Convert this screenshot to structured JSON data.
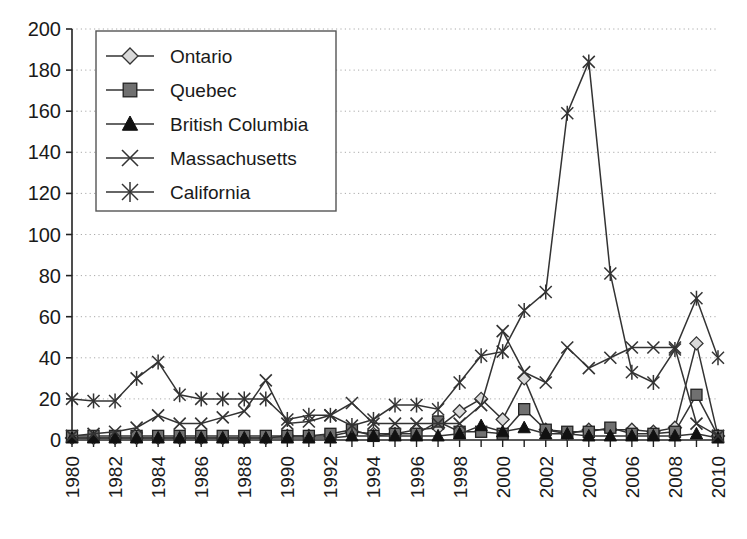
{
  "chart_data": {
    "type": "line",
    "title": "",
    "subtitle": "",
    "xlabel": "",
    "ylabel": "",
    "xlim": [
      1980,
      2010
    ],
    "ylim": [
      0,
      200
    ],
    "y_ticks": [
      0,
      20,
      40,
      60,
      80,
      100,
      120,
      140,
      160,
      180,
      200
    ],
    "y_tick_labels": [
      "0",
      "20",
      "40",
      "60",
      "80",
      "100",
      "120",
      "140",
      "160",
      "180",
      "200"
    ],
    "x": [
      1980,
      1981,
      1982,
      1983,
      1984,
      1985,
      1986,
      1987,
      1988,
      1989,
      1990,
      1991,
      1992,
      1993,
      1994,
      1995,
      1996,
      1997,
      1998,
      1999,
      2000,
      2001,
      2002,
      2003,
      2004,
      2005,
      2006,
      2007,
      2008,
      2009,
      2010
    ],
    "x_tick_labels": [
      "1980",
      "",
      "1982",
      "",
      "1984",
      "",
      "1986",
      "",
      "1988",
      "",
      "1990",
      "",
      "1992",
      "",
      "1994",
      "",
      "1996",
      "",
      "1998",
      "",
      "2000",
      "",
      "2002",
      "",
      "2004",
      "",
      "2006",
      "",
      "2008",
      "",
      "2010"
    ],
    "x_tick_label_rotation": -90,
    "grid": true,
    "grid_style": "dotted-horizontal",
    "legend_position": "top-left-inside",
    "marker_legend": {
      "Ontario": "diamond",
      "Quebec": "square",
      "British Columbia": "triangle",
      "Massachusetts": "x-cross",
      "California": "asterisk"
    },
    "series": [
      {
        "name": "Ontario",
        "marker": "diamond",
        "color": "#333333",
        "fill": "#d9d9d9",
        "values": [
          1,
          1,
          1,
          1,
          1,
          1,
          1,
          1,
          1,
          1,
          2,
          2,
          2,
          4,
          3,
          3,
          5,
          6,
          14,
          20,
          10,
          30,
          5,
          3,
          5,
          5,
          5,
          4,
          6,
          47,
          2
        ]
      },
      {
        "name": "Quebec",
        "marker": "square",
        "color": "#333333",
        "fill": "#707070",
        "values": [
          2,
          2,
          2,
          2,
          2,
          2,
          2,
          2,
          2,
          2,
          2,
          2,
          3,
          5,
          2,
          3,
          3,
          9,
          4,
          4,
          3,
          15,
          5,
          4,
          4,
          6,
          3,
          3,
          4,
          22,
          2
        ]
      },
      {
        "name": "British Columbia",
        "marker": "triangle",
        "color": "#111111",
        "fill": "#111111",
        "values": [
          1,
          1,
          1,
          1,
          1,
          1,
          1,
          1,
          1,
          1,
          1,
          1,
          1,
          2,
          2,
          2,
          2,
          2,
          3,
          7,
          4,
          6,
          3,
          3,
          2,
          2,
          2,
          2,
          2,
          3,
          1
        ]
      },
      {
        "name": "Massachusetts",
        "marker": "x-cross",
        "color": "#333333",
        "fill": "none",
        "values": [
          2,
          3,
          4,
          6,
          12,
          8,
          8,
          11,
          14,
          29,
          8,
          9,
          12,
          18,
          8,
          8,
          8,
          8,
          8,
          17,
          53,
          33,
          28,
          45,
          35,
          40,
          45,
          45,
          45,
          8,
          2
        ]
      },
      {
        "name": "California",
        "marker": "asterisk",
        "color": "#333333",
        "fill": "none",
        "values": [
          20,
          19,
          19,
          30,
          38,
          22,
          20,
          20,
          20,
          20,
          10,
          12,
          12,
          7,
          10,
          17,
          17,
          15,
          28,
          41,
          43,
          63,
          72,
          159,
          184,
          81,
          33,
          28,
          44,
          69,
          40
        ]
      }
    ]
  },
  "legend": {
    "entries": [
      {
        "label": "Ontario"
      },
      {
        "label": "Quebec"
      },
      {
        "label": "British Columbia"
      },
      {
        "label": "Massachusetts"
      },
      {
        "label": "California"
      }
    ]
  },
  "colors": {
    "axis": "#222222",
    "grid": "#aaaaaa",
    "line": "#333333",
    "ontario_fill": "#d9d9d9",
    "quebec_fill": "#707070",
    "bc_fill": "#111111",
    "background": "#ffffff"
  }
}
